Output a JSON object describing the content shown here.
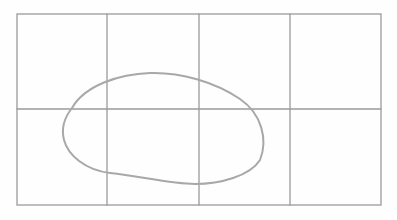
{
  "diagram": {
    "grid": {
      "columns": 4,
      "rows": 2,
      "left": 17,
      "top": 14,
      "right": 381,
      "bottom": 205,
      "vertical_lines": [
        107,
        199,
        290
      ],
      "horizontal_lines": [
        109
      ],
      "stroke_color": "#9a9a9a"
    },
    "loop": {
      "stroke_color": "#a8a8a8",
      "bounds": {
        "x_min": 63,
        "x_max": 265,
        "y_min": 73,
        "y_max": 184
      }
    }
  }
}
